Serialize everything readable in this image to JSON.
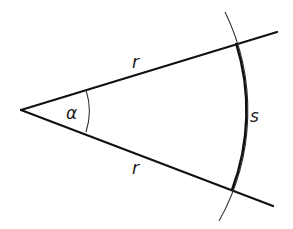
{
  "diagram": {
    "labels": {
      "radius_upper": "r",
      "radius_lower": "r",
      "angle": "α",
      "arc": "s"
    },
    "colors": {
      "stroke": "#111111",
      "thin_stroke": "#333333",
      "background": "#ffffff"
    }
  }
}
